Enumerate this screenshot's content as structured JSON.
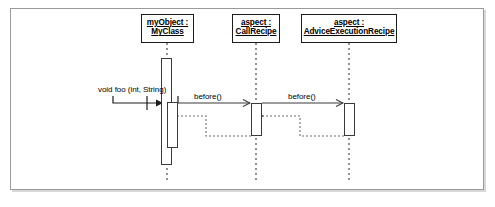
{
  "diagram": {
    "type": "uml-sequence-diagram",
    "frame": {
      "border_color": "#9a9a9a",
      "background": "#ffffff"
    },
    "line_color": "#3a3a3a",
    "text_color": "#000000",
    "participants": [
      {
        "id": "myobject",
        "name_line1": "myObject :",
        "name_line2": "MyClass",
        "x": 141,
        "y": 14,
        "width": 53,
        "height": 29,
        "lifeline_x": 167
      },
      {
        "id": "callrecipe",
        "name_line1": "aspect :",
        "name_line2": "CallRecipe",
        "x": 232,
        "y": 14,
        "width": 48,
        "height": 29,
        "lifeline_x": 256
      },
      {
        "id": "adviceexecutionrecipe",
        "name_line1": "aspect :",
        "name_line2": "AdviceExecutionRecipe",
        "x": 301,
        "y": 14,
        "width": 96,
        "height": 29,
        "lifeline_x": 349
      }
    ],
    "activations": [
      {
        "id": "act-myobject-outer",
        "participant": "myobject",
        "x": 161,
        "y": 58,
        "width": 11,
        "height": 107
      },
      {
        "id": "act-myobject-inner",
        "participant": "myobject",
        "x": 167,
        "y": 102,
        "width": 11,
        "height": 46
      },
      {
        "id": "act-callrecipe",
        "participant": "callrecipe",
        "x": 251,
        "y": 103,
        "width": 11,
        "height": 33
      },
      {
        "id": "act-advice",
        "participant": "adviceexecutionrecipe",
        "x": 344,
        "y": 103,
        "width": 11,
        "height": 33
      }
    ],
    "messages": [
      {
        "id": "msg-void-foo",
        "label": "void foo (int, String)",
        "label_x": 98,
        "label_y": 85,
        "kind": "found-call",
        "arrow_style": "solid",
        "arrowhead": "filled"
      },
      {
        "id": "msg-before-1",
        "label": "before()",
        "label_x": 194,
        "label_y": 92,
        "kind": "call",
        "arrow_style": "solid",
        "arrowhead": "open",
        "from": "myobject",
        "to": "callrecipe"
      },
      {
        "id": "msg-before-2",
        "label": "before()",
        "label_x": 288,
        "label_y": 92,
        "kind": "call",
        "arrow_style": "solid",
        "arrowhead": "open",
        "from": "callrecipe",
        "to": "adviceexecutionrecipe"
      },
      {
        "id": "msg-return-1",
        "label": "",
        "kind": "return",
        "arrow_style": "dotted",
        "arrowhead": "open",
        "from": "callrecipe",
        "to": "myobject"
      },
      {
        "id": "msg-return-2",
        "label": "",
        "kind": "return",
        "arrow_style": "dotted",
        "arrowhead": "open",
        "from": "adviceexecutionrecipe",
        "to": "callrecipe"
      }
    ]
  }
}
